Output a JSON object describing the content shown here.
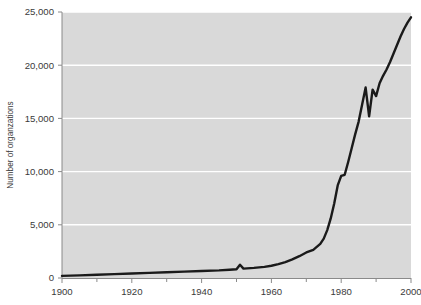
{
  "chart_data": {
    "type": "line",
    "title": "",
    "xlabel": "",
    "ylabel": "Number of organzations",
    "xlim": [
      1900,
      2000
    ],
    "ylim": [
      0,
      25000
    ],
    "grid": "horizontal",
    "legend": "none",
    "x_ticks": [
      "1900",
      "1920",
      "1940",
      "1960",
      "1980",
      "2000"
    ],
    "x_tick_values": [
      1900,
      1920,
      1940,
      1960,
      1980,
      2000
    ],
    "x_minor_tick_values": [
      1910,
      1930,
      1950,
      1970,
      1990
    ],
    "y_ticks": [
      "0",
      "5,000",
      "10,000",
      "15,000",
      "20,000",
      "25,000"
    ],
    "y_tick_values": [
      0,
      5000,
      10000,
      15000,
      20000,
      25000
    ],
    "series": [
      {
        "name": "Number of organizations",
        "color": "#1a1a1a",
        "x": [
          1900,
          1905,
          1910,
          1915,
          1920,
          1925,
          1930,
          1935,
          1940,
          1945,
          1948,
          1950,
          1951,
          1952,
          1953,
          1955,
          1958,
          1960,
          1962,
          1964,
          1966,
          1968,
          1970,
          1972,
          1974,
          1975,
          1976,
          1977,
          1978,
          1979,
          1980,
          1981,
          1982,
          1983,
          1984,
          1985,
          1986,
          1987,
          1988,
          1989,
          1990,
          1991,
          1992,
          1993,
          1994,
          1995,
          1996,
          1997,
          1998,
          1999,
          2000
        ],
        "y": [
          200,
          250,
          300,
          360,
          420,
          480,
          540,
          600,
          660,
          720,
          780,
          820,
          1250,
          880,
          900,
          950,
          1050,
          1150,
          1300,
          1500,
          1750,
          2050,
          2400,
          2650,
          3200,
          3700,
          4500,
          5600,
          7000,
          8700,
          9600,
          9700,
          10900,
          12200,
          13500,
          14700,
          16300,
          17900,
          15200,
          17700,
          17100,
          18300,
          19000,
          19600,
          20300,
          21100,
          21900,
          22700,
          23400,
          24000,
          24500
        ]
      }
    ],
    "annotations": [],
    "colors": {
      "plot_background": "#d9d9d9",
      "page_background": "#ffffff",
      "gridline": "#ffffff",
      "axis": "#8a8a8a",
      "line": "#1a1a1a",
      "text": "#3a3a3a"
    }
  }
}
